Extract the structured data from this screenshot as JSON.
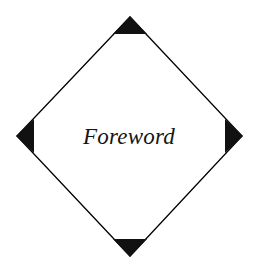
{
  "canvas": {
    "width": 258,
    "height": 266,
    "background_color": "#ffffff"
  },
  "diagram": {
    "type": "diamond-label",
    "shape_name": "diamond",
    "outline_color": "#000000",
    "fill_color": "#ffffff",
    "stroke_width": 1.3,
    "marker_color": "#111111",
    "vertices": {
      "top": {
        "x": 130,
        "y": 17
      },
      "right": {
        "x": 242,
        "y": 136
      },
      "bottom": {
        "x": 130,
        "y": 256
      },
      "left": {
        "x": 17,
        "y": 136
      }
    },
    "outline_points": "130,17 242,136 130,256 17,136",
    "markers": [
      {
        "name": "top-vertex-marker",
        "points": "130,16 147,34 113,34"
      },
      {
        "name": "right-vertex-marker",
        "points": "243,136 225,153 225,119"
      },
      {
        "name": "bottom-vertex-marker",
        "points": "130,257 113,239 147,239"
      },
      {
        "name": "left-vertex-marker",
        "points": "16,136 34,119 34,153"
      }
    ],
    "label": {
      "text": "Foreword",
      "x": 129,
      "y": 144,
      "font_size": 23,
      "color": "#151515"
    }
  }
}
